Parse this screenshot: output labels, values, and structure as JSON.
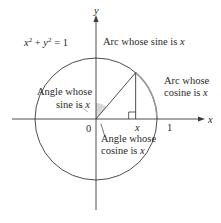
{
  "diagram": {
    "equation": {
      "base_x": "x",
      "base_y": "y",
      "exp": "2",
      "plus": " + ",
      "equals": " = 1"
    },
    "axes": {
      "x_label": "x",
      "y_label": "y",
      "origin_label": "0",
      "one_label": "1",
      "x_tick_label": "x"
    },
    "point_x_fraction": 0.65,
    "labels": {
      "arc_sine": {
        "text": "Arc whose sine is ",
        "var": "x"
      },
      "arc_cosine_line1": "Arc whose",
      "arc_cosine_line2": {
        "text": "cosine is ",
        "var": "x"
      },
      "angle_sine_line1": "Angle whose",
      "angle_sine_line2": {
        "text": "sine is ",
        "var": "x"
      },
      "angle_cosine_line1": "Angle whose",
      "angle_cosine_line2": {
        "text": "cosine is ",
        "var": "x"
      }
    },
    "colors": {
      "circle": "#3a3a3a",
      "cosine_arc": "#9a9a9a",
      "angle_shade": "#d8d8d8",
      "text": "#2a2a2a"
    }
  }
}
